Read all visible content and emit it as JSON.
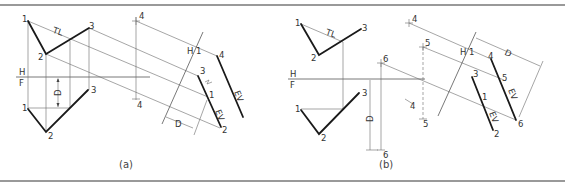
{
  "figure": {
    "panels": [
      {
        "caption": "(a)",
        "fold_line_top": "H",
        "fold_line_bottom": "F",
        "aux_fold_label": "H",
        "aux_fold_sub": "1",
        "true_length_label": "TL",
        "depth_label": "D",
        "edge_view_label": "EV",
        "top_points": {
          "p1": "1",
          "p2": "2",
          "p3": "3",
          "p4": "4"
        },
        "front_points": {
          "p1": "1",
          "p2": "2",
          "p3": "3",
          "p4": "4"
        },
        "aux_points": {
          "p1": "1",
          "p2": "2",
          "p3": "3",
          "p4": "4"
        }
      },
      {
        "caption": "(b)",
        "fold_line_top": "H",
        "fold_line_bottom": "F",
        "aux_fold_label": "H",
        "aux_fold_sub": "1",
        "true_length_label": "TL",
        "depth_label": "D",
        "depth_sub": "1",
        "edge_view_label": "EV",
        "top_points": {
          "p1": "1",
          "p2": "2",
          "p3": "3",
          "p4": "4",
          "p5": "5",
          "p6": "6"
        },
        "front_points": {
          "p1": "1",
          "p2": "2",
          "p3": "3",
          "p4": "4",
          "p5": "5",
          "p6": "6"
        },
        "aux_points": {
          "p1": "1",
          "p2": "2",
          "p3": "3",
          "p4": "4",
          "p5": "5",
          "p6": "6"
        }
      }
    ]
  }
}
